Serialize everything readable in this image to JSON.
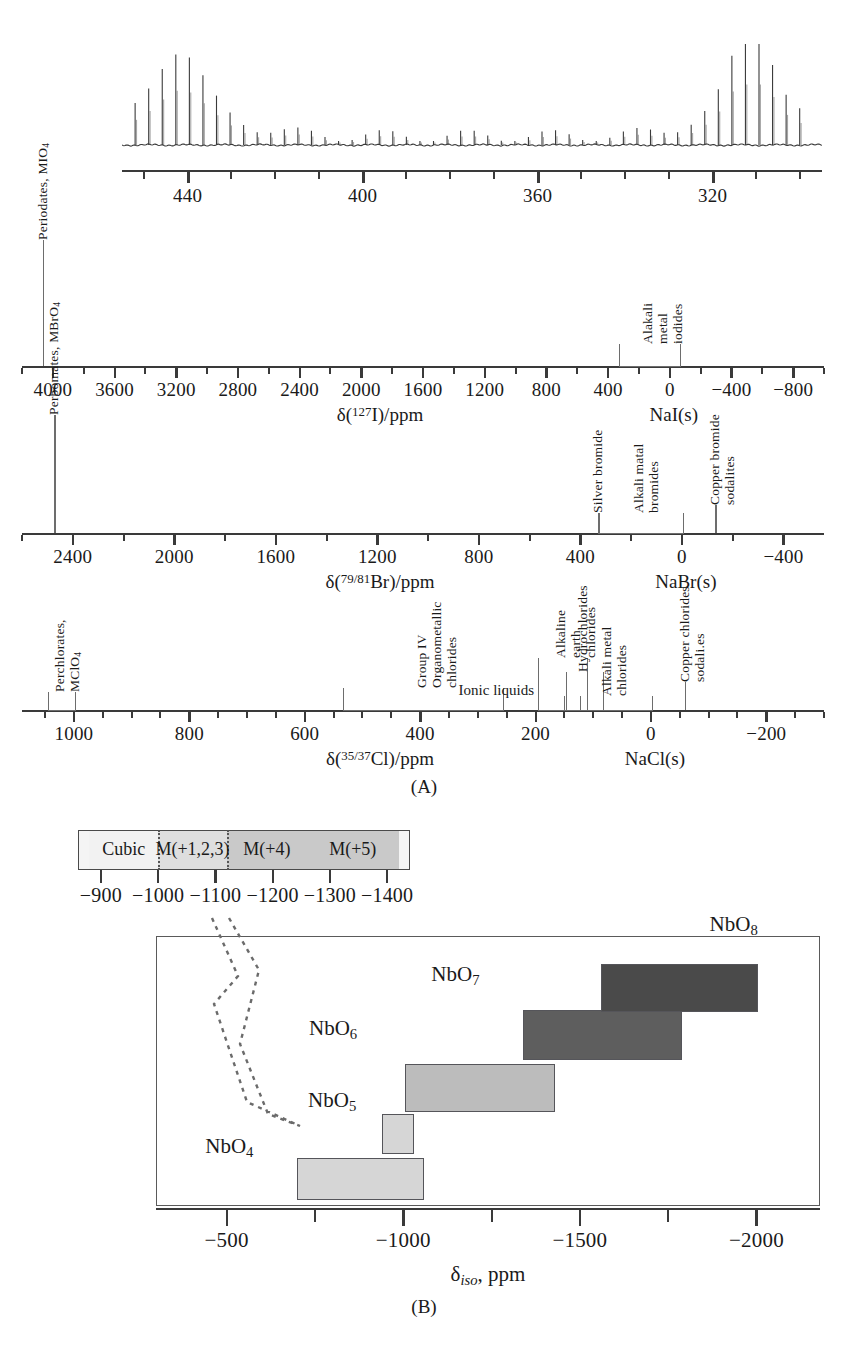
{
  "figure": {
    "panel_a_label": "(A)",
    "panel_b_label": "(B)"
  },
  "chart_data": [
    {
      "type": "line",
      "name": "iodine-127-mas-nmr-spectrum",
      "title": "",
      "xlabel": "",
      "ylabel": "",
      "xlim": [
        455,
        295
      ],
      "tick_labels": [
        "440",
        "400",
        "360",
        "320"
      ],
      "tick_values": [
        440,
        400,
        360,
        320
      ],
      "minor_tick_step": 10,
      "description": "127I MAS NMR spinning-sideband manifold",
      "peaks_centers": [
        442,
        311
      ],
      "sideband_spacing": 3.1
    },
    {
      "type": "range-scale",
      "name": "iodine-127-shift-scale",
      "axis_label": "δ(127I)/ppm",
      "axis_label_html": "δ(<sup>127</sup>I)/ppm",
      "reference": "NaI(s)",
      "reference_value": 0,
      "xlim": [
        4200,
        -1000
      ],
      "tick_labels": [
        "4000",
        "3600",
        "3200",
        "2800",
        "2400",
        "2000",
        "1600",
        "1200",
        "800",
        "400",
        "0",
        "−400",
        "−800"
      ],
      "tick_values": [
        4000,
        3600,
        3200,
        2800,
        2400,
        2000,
        1600,
        1200,
        800,
        400,
        0,
        -400,
        -800
      ],
      "minor_tick_step": 200,
      "ranges": [
        {
          "label": "Alakali metal\niodides",
          "type": "bracket",
          "from": 330,
          "to": -60
        }
      ],
      "markers": [
        {
          "label": "Periodates, MIO4",
          "label_html": "Periodates, MIO<sub>4</sub>",
          "type": "line",
          "at": 4060
        }
      ]
    },
    {
      "type": "range-scale",
      "name": "bromine-79-81-shift-scale",
      "axis_label": "δ(79/81Br)/ppm",
      "axis_label_html": "δ(<sup>79/81</sup>Br)/ppm",
      "reference": "NaBr(s)",
      "reference_value": 0,
      "xlim": [
        2600,
        -560
      ],
      "tick_labels": [
        "2400",
        "2000",
        "1600",
        "1200",
        "800",
        "400",
        "0",
        "−400"
      ],
      "tick_values": [
        2400,
        2000,
        1600,
        1200,
        800,
        400,
        0,
        -400
      ],
      "minor_tick_step": 200,
      "ranges": [
        {
          "label": "Alkali matal\nbromides",
          "type": "bracket",
          "from": 330,
          "to": 0
        }
      ],
      "markers": [
        {
          "label": "Perbomates, MBrO4",
          "label_html": "Perbomates, MBrO<sub>4</sub>",
          "type": "line",
          "at": 2470
        },
        {
          "label": "Silver bromide",
          "type": "line",
          "at": 325
        },
        {
          "label": "Copper bromide\nsodalites",
          "type": "line",
          "at": -135
        }
      ]
    },
    {
      "type": "range-scale",
      "name": "chlorine-35-37-shift-scale",
      "axis_label": "δ(35/37Cl)/ppm",
      "axis_label_html": "δ(<sup>35/37</sup>Cl)/ppm",
      "reference": "NaCl(s)",
      "reference_value": 0,
      "xlim": [
        1090,
        -300
      ],
      "tick_labels": [
        "1000",
        "800",
        "600",
        "400",
        "200",
        "0",
        "−200"
      ],
      "tick_values": [
        1000,
        800,
        600,
        400,
        200,
        0,
        -200
      ],
      "minor_tick_step": 50,
      "ranges": [
        {
          "label": "Perchlorates, MClO4",
          "label_html": "Perchlorates, MClO<sub>4</sub>",
          "type": "bracket",
          "from": 1045,
          "to": 1000
        },
        {
          "label": "Group IV\nOrganometallic\nchlorides",
          "type": "bracket",
          "from": 533,
          "to": 258
        },
        {
          "label": "Alkaline earth\nchlorides",
          "type": "bracket",
          "from": 196,
          "to": 112
        },
        {
          "label": "Hydrochlorides",
          "type": "bracket",
          "from": 148,
          "to": 85
        },
        {
          "label": "Ionic liquids",
          "type": "bracket",
          "from": 150,
          "to": 125
        },
        {
          "label": "Alkali metal\nchlorides",
          "type": "bracket",
          "from": 150,
          "to": 0
        },
        {
          "label": "Copper chlorides\nsodali.es",
          "type": "line",
          "at": -60
        }
      ]
    },
    {
      "type": "range-scale",
      "name": "cubic-coordination-bar",
      "axis_label": "",
      "xlim": [
        -860,
        -1440
      ],
      "tick_labels": [
        "−900",
        "−1000",
        "−1100",
        "−1200",
        "−1300",
        "−1400"
      ],
      "tick_values": [
        -900,
        -1000,
        -1100,
        -1200,
        -1300,
        -1400
      ],
      "segments": [
        {
          "label": "Cubic",
          "from": -880,
          "to": -1000,
          "color": "#f2f2f2"
        },
        {
          "label": "M(+1,2,3)",
          "from": -1000,
          "to": -1120,
          "color": "#dedede"
        },
        {
          "label": "M(+4)",
          "from": -1120,
          "to": -1260,
          "color": "#c9c9c9"
        },
        {
          "label": "M(+5)",
          "from": -1260,
          "to": -1420,
          "color": "#c9c9c9"
        }
      ]
    },
    {
      "type": "bar",
      "name": "niobium-93-coordination-ranges",
      "title": "",
      "xlabel": "δiso, ppm",
      "xlabel_html": "δ<i>iso</i>, ppm",
      "ylabel": "",
      "xlim": [
        -300,
        -2180
      ],
      "tick_labels": [
        "−500",
        "−1000",
        "−1500",
        "−2000"
      ],
      "tick_values": [
        -500,
        -1000,
        -1500,
        -2000
      ],
      "minor_tick_step": 250,
      "categories": [
        "NbO4",
        "NbO5",
        "NbO6",
        "NbO7",
        "NbO8"
      ],
      "bars": [
        {
          "label": "NbO4",
          "label_html": "NbO<sub>4</sub>",
          "from": -700,
          "to": -1060,
          "color": "#d6d6d6",
          "row": 0
        },
        {
          "label": "NbO5",
          "label_html": "NbO<sub>5</sub>",
          "from": -940,
          "to": -1030,
          "color": "#d6d6d6",
          "row": 1
        },
        {
          "label": "NbO6",
          "label_html": "NbO<sub>6</sub>",
          "from": -1005,
          "to": -1430,
          "color": "#bcbcbc",
          "row": 2
        },
        {
          "label": "NbO7",
          "label_html": "NbO<sub>7</sub>",
          "from": -1340,
          "to": -1790,
          "color": "#5e5e5e",
          "row": 3
        },
        {
          "label": "NbO8",
          "label_html": "NbO<sub>8</sub>",
          "from": -1560,
          "to": -2005,
          "color": "#4a4a4a",
          "row": 4
        }
      ],
      "annotation": "dashed leader lines connecting cubic inset to NbO6 region"
    }
  ],
  "colors": {
    "ink": "#1a1a1a",
    "axis": "#3a3a3a",
    "bracket": "#6d6d6d",
    "bar_light": "#d6d6d6",
    "bar_mid": "#bcbcbc",
    "bar_dark": "#4a4a4a",
    "box_border": "#5a5a5a"
  }
}
